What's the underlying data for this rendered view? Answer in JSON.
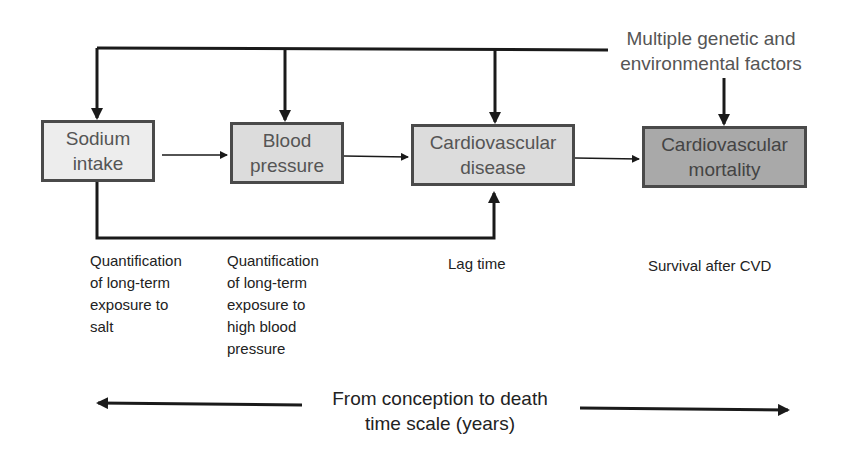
{
  "diagram": {
    "nodes": [
      {
        "id": "sodium",
        "label": "Sodium\nintake",
        "shade": "light"
      },
      {
        "id": "bp",
        "label": "Blood\npressure",
        "shade": "mid"
      },
      {
        "id": "cvd",
        "label": "Cardiovascular\ndisease",
        "shade": "mid"
      },
      {
        "id": "mortality",
        "label": "Cardiovascular\nmortality",
        "shade": "dark"
      }
    ],
    "factors_label": "Multiple genetic and\nenvironmental factors",
    "annotations": [
      "Quantification\nof long-term\nexposure to\nsalt",
      "Quantification\nof long-term\nexposure to\nhigh blood\npressure",
      "Lag time",
      "Survival after CVD"
    ],
    "timescale_label": "From conception to death\ntime scale (years)",
    "edges": [
      {
        "from": "sodium",
        "to": "bp"
      },
      {
        "from": "bp",
        "to": "cvd"
      },
      {
        "from": "cvd",
        "to": "mortality"
      },
      {
        "from": "sodium",
        "to": "cvd",
        "route": "below"
      },
      {
        "from": "factors",
        "to": "sodium"
      },
      {
        "from": "factors",
        "to": "bp"
      },
      {
        "from": "factors",
        "to": "cvd"
      },
      {
        "from": "factors",
        "to": "mortality"
      }
    ],
    "colors": {
      "line": "#1a1a1a",
      "box_border": "#4a4a4a",
      "box_light": "#ededed",
      "box_mid": "#dcdcdc",
      "box_dark": "#a9a9a9"
    }
  }
}
